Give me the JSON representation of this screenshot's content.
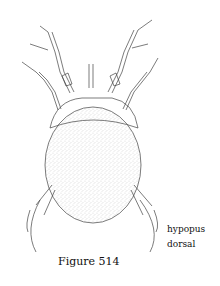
{
  "figure": {
    "labels": [
      "hypopus",
      "dorsal"
    ],
    "caption": "Figure 514"
  }
}
